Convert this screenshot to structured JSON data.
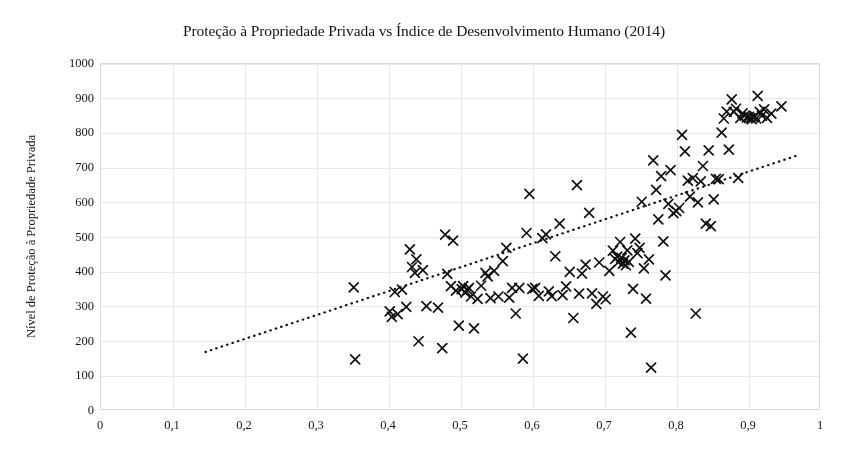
{
  "chart_data": {
    "type": "scatter",
    "title": "Proteção à Propriedade Privada vs Índice de Desenvolvimento Humano (2014)",
    "xlabel": "",
    "ylabel": "Nível de Proteção à Propriedade Privada",
    "xlim": [
      0,
      1
    ],
    "ylim": [
      0,
      1000
    ],
    "xticks": [
      0,
      0.1,
      0.2,
      0.3,
      0.4,
      0.5,
      0.6,
      0.7,
      0.8,
      0.9,
      1
    ],
    "xtick_labels": [
      "0",
      "0,1",
      "0,2",
      "0,3",
      "0,4",
      "0,5",
      "0,6",
      "0,7",
      "0,8",
      "0,9",
      "1"
    ],
    "yticks": [
      0,
      100,
      200,
      300,
      400,
      500,
      600,
      700,
      800,
      900,
      1000
    ],
    "ytick_labels": [
      "0",
      "100",
      "200",
      "300",
      "400",
      "500",
      "600",
      "700",
      "800",
      "900",
      "1000"
    ],
    "grid": true,
    "grid_color": "#e8e8e8",
    "legend": null,
    "marker": "x",
    "marker_color": "#111111",
    "marker_size": 9,
    "trendline": {
      "type": "linear",
      "style": "dotted",
      "color": "#111111",
      "x_start": 0.145,
      "y_start": 170,
      "x_end": 0.965,
      "y_end": 735
    },
    "points": [
      [
        0.351,
        356
      ],
      [
        0.353,
        149
      ],
      [
        0.401,
        287
      ],
      [
        0.404,
        271
      ],
      [
        0.408,
        343
      ],
      [
        0.412,
        279
      ],
      [
        0.418,
        350
      ],
      [
        0.424,
        300
      ],
      [
        0.429,
        466
      ],
      [
        0.432,
        415
      ],
      [
        0.436,
        398
      ],
      [
        0.438,
        437
      ],
      [
        0.441,
        201
      ],
      [
        0.447,
        406
      ],
      [
        0.452,
        302
      ],
      [
        0.468,
        298
      ],
      [
        0.474,
        181
      ],
      [
        0.478,
        508
      ],
      [
        0.481,
        395
      ],
      [
        0.486,
        360
      ],
      [
        0.489,
        491
      ],
      [
        0.493,
        347
      ],
      [
        0.497,
        246
      ],
      [
        0.501,
        351
      ],
      [
        0.503,
        360
      ],
      [
        0.506,
        341
      ],
      [
        0.509,
        350
      ],
      [
        0.511,
        355
      ],
      [
        0.514,
        330
      ],
      [
        0.518,
        238
      ],
      [
        0.523,
        323
      ],
      [
        0.528,
        361
      ],
      [
        0.534,
        398
      ],
      [
        0.537,
        388
      ],
      [
        0.541,
        325
      ],
      [
        0.546,
        404
      ],
      [
        0.552,
        330
      ],
      [
        0.558,
        432
      ],
      [
        0.563,
        470
      ],
      [
        0.567,
        327
      ],
      [
        0.571,
        355
      ],
      [
        0.576,
        281
      ],
      [
        0.581,
        355
      ],
      [
        0.586,
        151
      ],
      [
        0.591,
        513
      ],
      [
        0.595,
        626
      ],
      [
        0.599,
        352
      ],
      [
        0.603,
        355
      ],
      [
        0.608,
        332
      ],
      [
        0.613,
        498
      ],
      [
        0.618,
        509
      ],
      [
        0.622,
        345
      ],
      [
        0.626,
        331
      ],
      [
        0.631,
        446
      ],
      [
        0.637,
        540
      ],
      [
        0.641,
        334
      ],
      [
        0.646,
        359
      ],
      [
        0.651,
        401
      ],
      [
        0.656,
        268
      ],
      [
        0.661,
        651
      ],
      [
        0.664,
        338
      ],
      [
        0.668,
        396
      ],
      [
        0.673,
        422
      ],
      [
        0.678,
        571
      ],
      [
        0.682,
        339
      ],
      [
        0.688,
        309
      ],
      [
        0.692,
        428
      ],
      [
        0.697,
        330
      ],
      [
        0.701,
        322
      ],
      [
        0.706,
        404
      ],
      [
        0.711,
        462
      ],
      [
        0.714,
        438
      ],
      [
        0.717,
        445
      ],
      [
        0.719,
        430
      ],
      [
        0.721,
        487
      ],
      [
        0.723,
        441
      ],
      [
        0.725,
        425
      ],
      [
        0.727,
        434
      ],
      [
        0.729,
        420
      ],
      [
        0.731,
        463
      ],
      [
        0.733,
        430
      ],
      [
        0.736,
        226
      ],
      [
        0.739,
        352
      ],
      [
        0.742,
        497
      ],
      [
        0.745,
        455
      ],
      [
        0.748,
        470
      ],
      [
        0.751,
        603
      ],
      [
        0.754,
        411
      ],
      [
        0.757,
        324
      ],
      [
        0.761,
        437
      ],
      [
        0.764,
        125
      ],
      [
        0.767,
        722
      ],
      [
        0.771,
        637
      ],
      [
        0.774,
        552
      ],
      [
        0.778,
        677
      ],
      [
        0.781,
        489
      ],
      [
        0.784,
        391
      ],
      [
        0.788,
        597
      ],
      [
        0.791,
        694
      ],
      [
        0.795,
        570
      ],
      [
        0.799,
        576
      ],
      [
        0.803,
        585
      ],
      [
        0.807,
        796
      ],
      [
        0.811,
        748
      ],
      [
        0.815,
        664
      ],
      [
        0.818,
        618
      ],
      [
        0.822,
        671
      ],
      [
        0.826,
        281
      ],
      [
        0.829,
        601
      ],
      [
        0.833,
        662
      ],
      [
        0.836,
        706
      ],
      [
        0.84,
        540
      ],
      [
        0.844,
        751
      ],
      [
        0.847,
        533
      ],
      [
        0.851,
        610
      ],
      [
        0.854,
        669
      ],
      [
        0.858,
        668
      ],
      [
        0.862,
        802
      ],
      [
        0.865,
        843
      ],
      [
        0.869,
        863
      ],
      [
        0.872,
        753
      ],
      [
        0.876,
        898
      ],
      [
        0.879,
        862
      ],
      [
        0.882,
        871
      ],
      [
        0.885,
        672
      ],
      [
        0.888,
        845
      ],
      [
        0.891,
        858
      ],
      [
        0.894,
        851
      ],
      [
        0.897,
        846
      ],
      [
        0.9,
        848
      ],
      [
        0.902,
        844
      ],
      [
        0.904,
        841
      ],
      [
        0.906,
        846
      ],
      [
        0.908,
        850
      ],
      [
        0.91,
        843
      ],
      [
        0.912,
        908
      ],
      [
        0.915,
        862
      ],
      [
        0.918,
        851
      ],
      [
        0.921,
        869
      ],
      [
        0.925,
        845
      ],
      [
        0.931,
        857
      ],
      [
        0.945,
        878
      ]
    ]
  }
}
